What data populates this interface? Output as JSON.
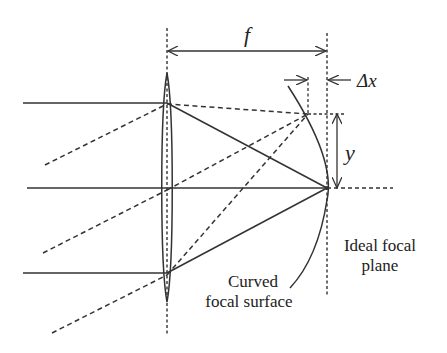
{
  "diagram": {
    "labels": {
      "focal_length": "f",
      "delta_x": "Δx",
      "height": "y",
      "ideal_plane_line1": "Ideal focal",
      "ideal_plane_line2": "plane",
      "curved_surface_line1": "Curved",
      "curved_surface_line2": "focal surface"
    },
    "colors": {
      "stroke": "#333333",
      "background": "#ffffff"
    },
    "elements": {
      "lens": {
        "type": "thin biconvex lens",
        "x": 167,
        "top": 73,
        "bottom": 302
      },
      "focal_point": {
        "x": 327,
        "y": 188
      },
      "off_axis_focus": {
        "x": 308,
        "y": 114
      },
      "parallel_rays": [
        {
          "name": "top",
          "y": 103
        },
        {
          "name": "axis",
          "y": 188
        },
        {
          "name": "bottom",
          "y": 273
        }
      ],
      "oblique_rays": 3
    }
  }
}
